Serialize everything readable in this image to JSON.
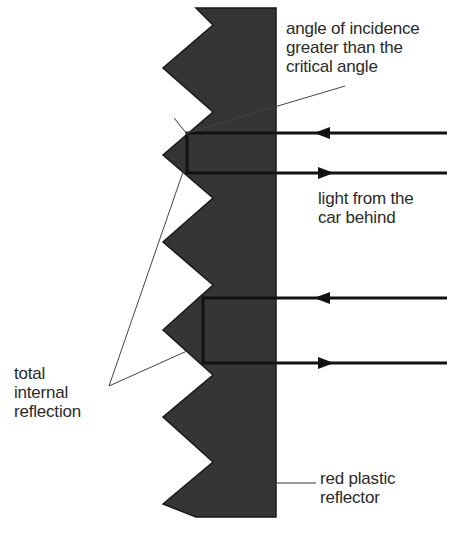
{
  "colors": {
    "reflector": "#353535",
    "ray": "#111111",
    "pointer": "#444444",
    "text": "#2a2a2a",
    "background": "#ffffff"
  },
  "labels": {
    "angle": [
      "angle of incidence",
      "greater than the",
      "critical angle"
    ],
    "light": [
      "light from the",
      "car behind"
    ],
    "tir": [
      "total",
      "internal",
      "reflection"
    ],
    "reflector": [
      "red plastic",
      "reflector"
    ]
  },
  "rays": [
    {
      "name": "ray-pair-upper",
      "incoming_y": 133,
      "outgoing_y": 173,
      "turn_x": 187
    },
    {
      "name": "ray-pair-lower",
      "incoming_y": 298,
      "outgoing_y": 363,
      "turn_x": 203
    }
  ]
}
